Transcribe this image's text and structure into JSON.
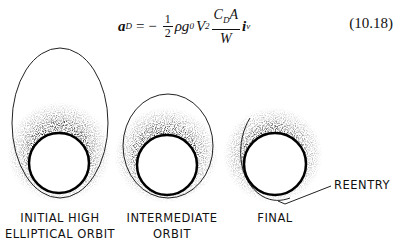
{
  "equation": {
    "lhs": "a",
    "lhs_sub": "D",
    "equals": "= −",
    "half_num": "1",
    "half_den": "2",
    "rho_g": "ρg",
    "g_sub": "0",
    "V": "V",
    "V_sup": "2",
    "frac_num": "C",
    "frac_num_sub": "D",
    "frac_num_tail": "A",
    "frac_den": "W",
    "unit": "i",
    "unit_sub": "v",
    "number": "(10.18)"
  },
  "figure": {
    "panels": [
      {
        "label_line1": "INITIAL HIGH",
        "label_line2": "ELLIPTICAL ORBIT"
      },
      {
        "label_line1": "INTERMEDIATE",
        "label_line2": "ORBIT"
      },
      {
        "label_line1": "FINAL",
        "label_line2": ""
      }
    ],
    "callout": "REENTRY"
  }
}
